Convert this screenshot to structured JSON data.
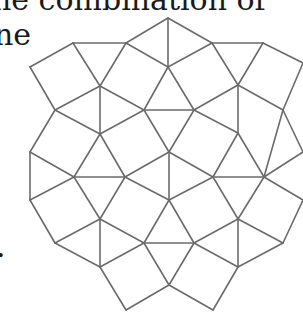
{
  "text_fragments": {
    "line1": "he combination of",
    "line2": "ne",
    "line3": "."
  },
  "figure": {
    "stroke_color": "#6b6b6b",
    "background": "#ffffff",
    "vertices": {
      "A": [
        168,
        18
      ],
      "B": [
        126,
        43
      ],
      "C": [
        212,
        43
      ],
      "D": [
        73,
        43
      ],
      "E": [
        263,
        43
      ],
      "F": [
        30,
        67
      ],
      "G": [
        168,
        67
      ],
      "H": [
        100,
        86
      ],
      "I": [
        238,
        85
      ],
      "J": [
        303,
        63
      ],
      "K": [
        55,
        110
      ],
      "L": [
        144,
        110
      ],
      "M": [
        194,
        110
      ],
      "N": [
        283,
        110
      ],
      "O": [
        100,
        134
      ],
      "P": [
        238,
        133
      ],
      "Q": [
        30,
        152
      ],
      "R": [
        169,
        152
      ],
      "S": [
        303,
        152
      ],
      "T": [
        74,
        177
      ],
      "U": [
        125,
        177
      ],
      "V": [
        213,
        177
      ],
      "W": [
        264,
        177
      ],
      "X": [
        30,
        200
      ],
      "Y": [
        169,
        200
      ],
      "Z": [
        303,
        200
      ],
      "a": [
        100,
        219
      ],
      "b": [
        238,
        219
      ],
      "c": [
        55,
        243
      ],
      "d": [
        144,
        243
      ],
      "e": [
        194,
        243
      ],
      "f": [
        283,
        243
      ],
      "g": [
        100,
        267
      ],
      "h": [
        238,
        267
      ],
      "i": [
        169,
        285
      ],
      "j": [
        126,
        310
      ],
      "k": [
        213,
        310
      ]
    },
    "edges": [
      [
        "A",
        "B"
      ],
      [
        "A",
        "C"
      ],
      [
        "A",
        "G"
      ],
      [
        "B",
        "G"
      ],
      [
        "C",
        "G"
      ],
      [
        "B",
        "D"
      ],
      [
        "D",
        "F"
      ],
      [
        "F",
        "K"
      ],
      [
        "D",
        "H"
      ],
      [
        "B",
        "H"
      ],
      [
        "K",
        "H"
      ],
      [
        "C",
        "I"
      ],
      [
        "C",
        "E"
      ],
      [
        "E",
        "I"
      ],
      [
        "E",
        "J"
      ],
      [
        "J",
        "N"
      ],
      [
        "N",
        "I"
      ],
      [
        "H",
        "L"
      ],
      [
        "G",
        "L"
      ],
      [
        "G",
        "M"
      ],
      [
        "L",
        "M"
      ],
      [
        "M",
        "I"
      ],
      [
        "H",
        "O"
      ],
      [
        "K",
        "O"
      ],
      [
        "L",
        "O"
      ],
      [
        "K",
        "Q"
      ],
      [
        "O",
        "T"
      ],
      [
        "O",
        "U"
      ],
      [
        "T",
        "U"
      ],
      [
        "Q",
        "T"
      ],
      [
        "Q",
        "X"
      ],
      [
        "X",
        "T"
      ],
      [
        "T",
        "a"
      ],
      [
        "U",
        "a"
      ],
      [
        "U",
        "R"
      ],
      [
        "L",
        "R"
      ],
      [
        "M",
        "R"
      ],
      [
        "U",
        "Y"
      ],
      [
        "M",
        "P"
      ],
      [
        "I",
        "P"
      ],
      [
        "P",
        "V"
      ],
      [
        "P",
        "W"
      ],
      [
        "V",
        "W"
      ],
      [
        "N",
        "W"
      ],
      [
        "N",
        "S"
      ],
      [
        "W",
        "S"
      ],
      [
        "W",
        "Z"
      ],
      [
        "R",
        "V"
      ],
      [
        "R",
        "Y"
      ],
      [
        "V",
        "Y"
      ],
      [
        "V",
        "b"
      ],
      [
        "W",
        "b"
      ],
      [
        "Y",
        "e"
      ],
      [
        "Y",
        "d"
      ],
      [
        "a",
        "c"
      ],
      [
        "a",
        "d"
      ],
      [
        "a",
        "g"
      ],
      [
        "c",
        "g"
      ],
      [
        "d",
        "g"
      ],
      [
        "X",
        "c"
      ],
      [
        "d",
        "e"
      ],
      [
        "e",
        "b"
      ],
      [
        "e",
        "h"
      ],
      [
        "b",
        "f"
      ],
      [
        "b",
        "h"
      ],
      [
        "f",
        "h"
      ],
      [
        "f",
        "Z"
      ],
      [
        "d",
        "i"
      ],
      [
        "e",
        "i"
      ],
      [
        "g",
        "j"
      ],
      [
        "j",
        "i"
      ],
      [
        "i",
        "k"
      ],
      [
        "k",
        "h"
      ]
    ]
  }
}
